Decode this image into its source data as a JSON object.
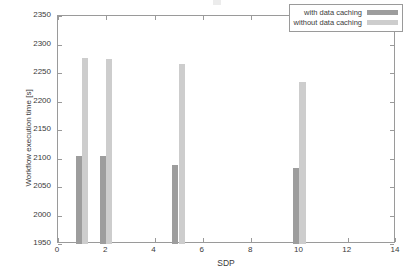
{
  "chart_data": {
    "type": "bar",
    "title": "",
    "xlabel": "SDP",
    "ylabel": "Workflow execution time [s]",
    "xlim": [
      0,
      14
    ],
    "ylim": [
      1950,
      2350
    ],
    "ytick_step": 50,
    "xtick_step": 2,
    "grid": false,
    "legend_position": "top-right",
    "x": [
      1,
      2,
      5,
      10
    ],
    "categories": [
      "1",
      "2",
      "5",
      "10"
    ],
    "bar_width": 0.55,
    "series": [
      {
        "name": "with data caching",
        "color": "#9d9d9d",
        "values": [
          2104,
          2104,
          2088,
          2084
        ]
      },
      {
        "name": "without data caching",
        "color": "#cdcdcd",
        "values": [
          2276,
          2274,
          2266,
          2235
        ]
      }
    ],
    "y_tick_labels": [
      "1950",
      "2000",
      "2050",
      "2100",
      "2150",
      "2200",
      "2250",
      "2300",
      "2350"
    ],
    "x_tick_labels": [
      "0",
      "2",
      "4",
      "6",
      "8",
      "10",
      "12",
      "14"
    ]
  },
  "axis": {
    "y_title": "Workflow execution time [s]",
    "x_title": "SDP"
  },
  "legend": {
    "entries": [
      {
        "label": "with data caching"
      },
      {
        "label": "without data caching"
      }
    ]
  }
}
